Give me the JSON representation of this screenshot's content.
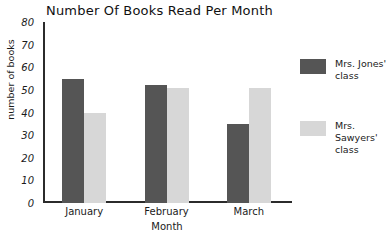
{
  "chart_data": {
    "type": "bar",
    "title": "Number Of Books Read Per Month",
    "xlabel": "Month",
    "ylabel": "number of books",
    "categories": [
      "January",
      "February",
      "March"
    ],
    "series": [
      {
        "name": "Mrs. Jones' class",
        "color": "#555555",
        "values": [
          55,
          52,
          35
        ]
      },
      {
        "name": "Mrs. Sawyers' class",
        "color": "#d7d7d7",
        "values": [
          40,
          51,
          51
        ]
      }
    ],
    "ylim": [
      0,
      80
    ],
    "yticks": [
      0,
      10,
      20,
      30,
      40,
      50,
      60,
      70,
      80
    ],
    "ytick_labels": [
      "0",
      "10",
      "20",
      "30",
      "40",
      "50",
      "60",
      "70",
      "80"
    ],
    "grid": false,
    "legend_position": "right"
  },
  "legend": {
    "entries": [
      {
        "label": "Mrs. Jones' class"
      },
      {
        "label": "Mrs. Sawyers' class"
      }
    ]
  }
}
